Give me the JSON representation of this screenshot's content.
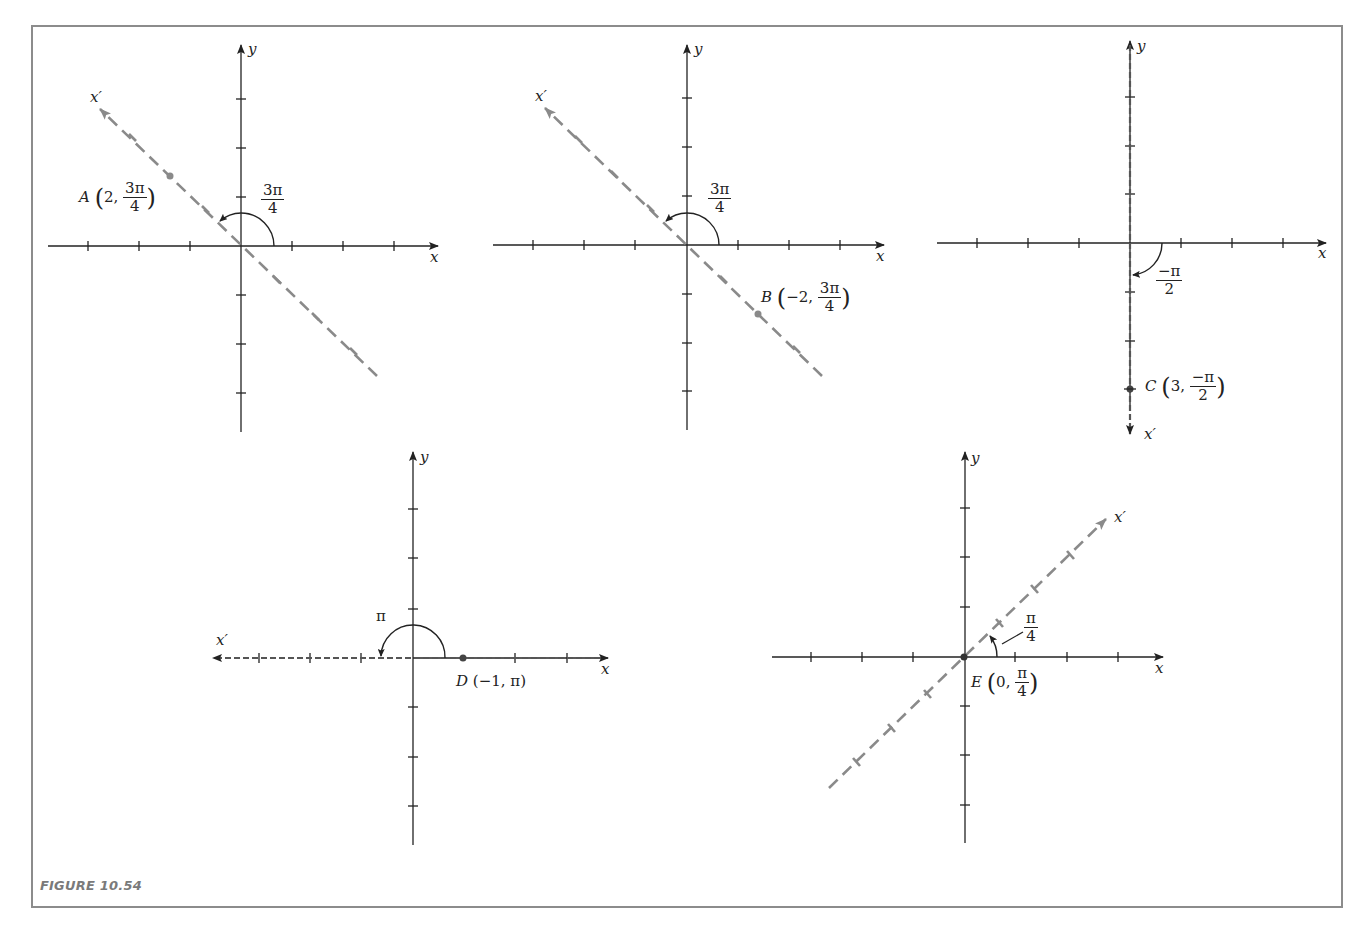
{
  "figure": {
    "caption": "FIGURE 10.54",
    "colors": {
      "axis": "#222222",
      "rotated_axis": "#8a8a8a",
      "frame": "#8c8c8c",
      "caption": "#7a7a7a"
    }
  },
  "panels": [
    {
      "id": "A",
      "x_label": "x",
      "y_label": "y",
      "rotated_label": "x′",
      "angle_label": {
        "num": "3π",
        "den": "4"
      },
      "point": {
        "name": "A",
        "r": "2",
        "theta_num": "3π",
        "theta_den": "4"
      }
    },
    {
      "id": "B",
      "x_label": "x",
      "y_label": "y",
      "rotated_label": "x′",
      "angle_label": {
        "num": "3π",
        "den": "4"
      },
      "point": {
        "name": "B",
        "r": "−2",
        "theta_num": "3π",
        "theta_den": "4"
      }
    },
    {
      "id": "C",
      "x_label": "x",
      "y_label": "y",
      "rotated_label": "x′",
      "angle_label": {
        "num": "−π",
        "den": "2"
      },
      "point": {
        "name": "C",
        "r": "3",
        "theta_num": "−π",
        "theta_den": "2"
      }
    },
    {
      "id": "D",
      "x_label": "x",
      "y_label": "y",
      "rotated_label": "x′",
      "angle_label": {
        "text": "π"
      },
      "point": {
        "name": "D",
        "coords": "(−1, π)"
      }
    },
    {
      "id": "E",
      "x_label": "x",
      "y_label": "y",
      "rotated_label": "x′",
      "angle_label": {
        "num": "π",
        "den": "4"
      },
      "point": {
        "name": "E",
        "r": "0",
        "theta_num": "π",
        "theta_den": "4"
      }
    }
  ]
}
